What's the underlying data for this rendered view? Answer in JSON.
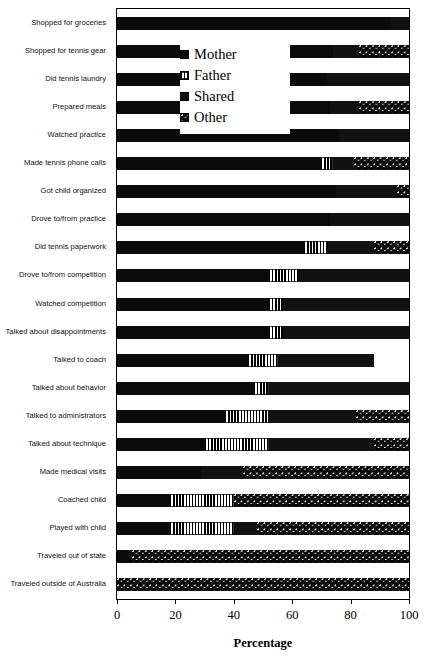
{
  "chart_data": {
    "type": "bar",
    "subtype": "stacked-horizontal-100",
    "title": "",
    "xlabel": "Percentage",
    "ylabel": "",
    "xlim": [
      0,
      100
    ],
    "xticks": [
      0,
      20,
      40,
      60,
      80,
      100
    ],
    "grid": false,
    "legend_position": "upper-center",
    "legend": [
      "Mother",
      "Father",
      "Shared",
      "Other"
    ],
    "series": [
      {
        "name": "Mother",
        "pattern": "solid-black",
        "values": [
          94,
          74,
          72,
          73,
          76,
          70,
          75,
          73,
          64,
          52,
          52,
          52,
          45,
          47,
          37,
          30,
          29,
          18,
          18,
          5,
          0
        ]
      },
      {
        "name": "Father",
        "pattern": "vertical-stripes",
        "values": [
          0,
          0,
          0,
          0,
          0,
          4,
          0,
          0,
          8,
          10,
          5,
          5,
          10,
          5,
          15,
          22,
          0,
          22,
          22,
          0,
          0
        ]
      },
      {
        "name": "Shared",
        "pattern": "checkerboard",
        "values": [
          6,
          9,
          28,
          10,
          24,
          7,
          21,
          27,
          16,
          38,
          43,
          43,
          33,
          48,
          30,
          36,
          14,
          0,
          8,
          0,
          0
        ]
      },
      {
        "name": "Other",
        "pattern": "dots",
        "values": [
          0,
          17,
          0,
          17,
          0,
          19,
          4,
          0,
          12,
          0,
          0,
          0,
          0,
          0,
          18,
          12,
          57,
          60,
          52,
          95,
          100
        ]
      }
    ],
    "categories": [
      "Shopped for groceries",
      "Shopped for tennis gear",
      "Did tennis laundry",
      "Prepared meals",
      "Watched practice",
      "Made tennis phone calls",
      "Got child organized",
      "Drove to/from practice",
      "Did tennis paperwork",
      "Drove to/from competition",
      "Watched competition",
      "Talked about disappointments",
      "Talked to coach",
      "Talked about behavior",
      "Talked to administrators",
      "Talked about technique",
      "Made medical visits",
      "Coached child",
      "Played with child",
      "Traveled out of state",
      "Traveled outside of Australia"
    ],
    "bar_totals": [
      100,
      100,
      100,
      100,
      100,
      100,
      100,
      100,
      100,
      100,
      100,
      100,
      88,
      100,
      100,
      100,
      100,
      100,
      100,
      100,
      100
    ],
    "colors": {
      "mother": "#0b0b0b",
      "father": "#ffffff",
      "shared": "#111111",
      "other": "#0b0b0b",
      "axis": "#000000",
      "background": "#ffffff"
    }
  },
  "axis": {
    "x_title": "Percentage",
    "tick_labels": [
      "0",
      "20",
      "40",
      "60",
      "80",
      "100"
    ]
  },
  "legend": {
    "items": [
      {
        "label": "Mother",
        "key": "m"
      },
      {
        "label": "Father",
        "key": "f"
      },
      {
        "label": "Shared",
        "key": "s"
      },
      {
        "label": "Other",
        "key": "o"
      }
    ]
  }
}
